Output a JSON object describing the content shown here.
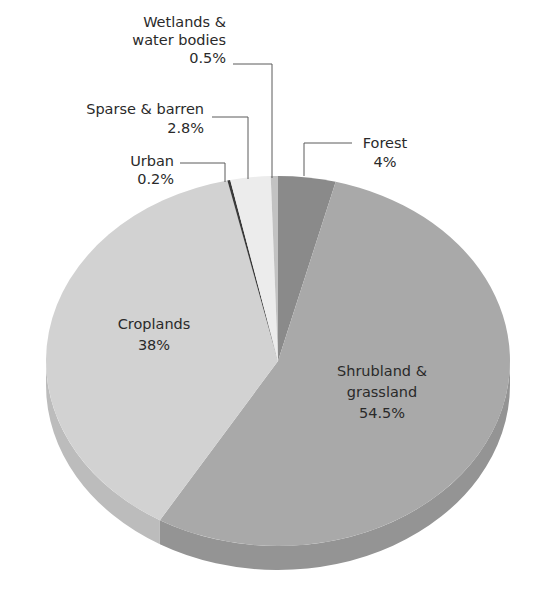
{
  "chart_data": {
    "type": "pie",
    "style": "3d-tilted",
    "title": "",
    "start_angle_deg_clockwise_from_top": 0,
    "slices": [
      {
        "name": "Forest",
        "label_lines": [
          "Forest"
        ],
        "value": 4,
        "value_label": "4%",
        "color": "#8a8a8a",
        "side_color": "#7a7a7a"
      },
      {
        "name": "Shrubland & grassland",
        "label_lines": [
          "Shrubland &",
          "grassland"
        ],
        "value": 54.5,
        "value_label": "54.5%",
        "color": "#a9a9a9",
        "side_color": "#949494"
      },
      {
        "name": "Croplands",
        "label_lines": [
          "Croplands"
        ],
        "value": 38,
        "value_label": "38%",
        "color": "#d2d2d2",
        "side_color": "#bcbcbc"
      },
      {
        "name": "Urban",
        "label_lines": [
          "Urban"
        ],
        "value": 0.2,
        "value_label": "0.2%",
        "color": "#3a3a3a",
        "side_color": "#2e2e2e"
      },
      {
        "name": "Sparse & barren",
        "label_lines": [
          "Sparse & barren"
        ],
        "value": 2.8,
        "value_label": "2.8%",
        "color": "#ececec",
        "side_color": "#d6d6d6"
      },
      {
        "name": "Wetlands & water bodies",
        "label_lines": [
          "Wetlands &",
          "water bodies"
        ],
        "value": 0.5,
        "value_label": "0.5%",
        "color": "#c2c2c2",
        "side_color": "#adadad"
      }
    ],
    "legend": "none (callout labels)",
    "grid": false
  },
  "labels": {
    "forest": {
      "lines": [
        "Forest",
        "4%"
      ]
    },
    "shrubland": {
      "lines": [
        "Shrubland &",
        "grassland",
        "54.5%"
      ]
    },
    "croplands": {
      "lines": [
        "Croplands",
        "38%"
      ]
    },
    "urban": {
      "lines": [
        "Urban",
        "0.2%"
      ]
    },
    "sparse": {
      "lines": [
        "Sparse & barren",
        "2.8%"
      ]
    },
    "wetlands": {
      "lines": [
        "Wetlands &",
        "water bodies",
        "0.5%"
      ]
    }
  }
}
